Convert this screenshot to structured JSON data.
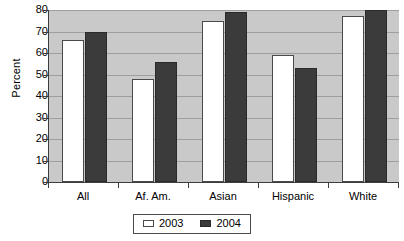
{
  "chart_data": {
    "type": "bar",
    "title": "",
    "subtitle": "",
    "xlabel": "",
    "ylabel": "Percent",
    "categories": [
      "All",
      "Af. Am.",
      "Asian",
      "Hispanic",
      "White"
    ],
    "series": [
      {
        "name": "2003",
        "values": [
          66,
          48,
          75,
          59,
          77
        ],
        "color": "#ffffff"
      },
      {
        "name": "2004",
        "values": [
          70,
          56,
          79,
          53,
          80
        ],
        "color": "#3b3b3b"
      }
    ],
    "ylim": [
      0,
      80
    ],
    "ytick_step": 10,
    "yticks": [
      80,
      70,
      60,
      50,
      40,
      30,
      20,
      10,
      0
    ],
    "ytick_labels": [
      "80",
      "70",
      "60",
      "50",
      "40",
      "30",
      "20",
      "10",
      "0"
    ],
    "grid": true,
    "grid_axis": "y",
    "legend_position": "bottom-center",
    "legend_entries": [
      "2003",
      "2004"
    ],
    "plot_background": "#c9c9c9",
    "gridline_color": "#9e9e9e",
    "axis_color": "#3d3d3d"
  }
}
